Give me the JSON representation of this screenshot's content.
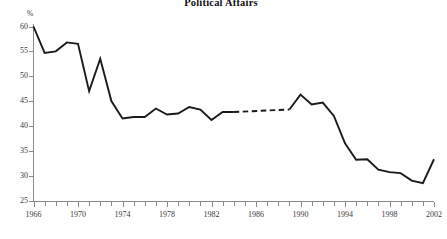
{
  "chart": {
    "title": "Political Affairs",
    "y_unit": "%"
  },
  "chart_data": {
    "type": "line",
    "title": "Political Affairs",
    "xlabel": "",
    "ylabel": "%",
    "ylim": [
      25,
      60
    ],
    "xlim": [
      1966,
      2002
    ],
    "ytick_labels": [
      "60",
      "55",
      "50",
      "45",
      "40",
      "35",
      "30",
      "25"
    ],
    "ytick_values": [
      60,
      55,
      50,
      45,
      40,
      35,
      30,
      25
    ],
    "xtick_labels": [
      "1966",
      "1970",
      "1974",
      "1978",
      "1982",
      "1986",
      "1990",
      "1994",
      "1998",
      "2002"
    ],
    "xtick_values": [
      1966,
      1970,
      1974,
      1978,
      1982,
      1986,
      1990,
      1994,
      1998,
      2002
    ],
    "xtick_minor_step": 1,
    "grid": false,
    "legend": null,
    "series": [
      {
        "name": "Political Affairs",
        "style": "solid",
        "x": [
          1966,
          1967,
          1968,
          1969,
          1970,
          1971,
          1972,
          1973,
          1974,
          1975,
          1976,
          1977,
          1978,
          1979,
          1980,
          1981,
          1982,
          1983,
          1984
        ],
        "values": [
          60.0,
          54.7,
          55.0,
          56.8,
          56.5,
          47.0,
          53.5,
          45.0,
          41.5,
          41.8,
          41.8,
          43.5,
          42.3,
          42.5,
          43.8,
          43.3,
          41.2,
          42.8,
          42.8
        ]
      },
      {
        "name": "Political Affairs (interpolated)",
        "style": "dashed",
        "x": [
          1984,
          1989
        ],
        "values": [
          42.8,
          43.3
        ]
      },
      {
        "name": "Political Affairs (cont.)",
        "style": "solid",
        "x": [
          1989,
          1990,
          1991,
          1992,
          1993,
          1994,
          1995,
          1996,
          1997,
          1998,
          1999,
          2000,
          2001,
          2002
        ],
        "values": [
          43.3,
          46.3,
          44.3,
          44.7,
          42.0,
          36.5,
          33.2,
          33.3,
          31.2,
          30.7,
          30.5,
          29.0,
          28.5,
          33.3
        ]
      }
    ]
  }
}
